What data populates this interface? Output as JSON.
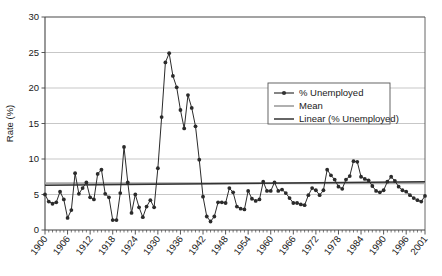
{
  "chart_data": {
    "type": "line",
    "title": "",
    "xlabel": "",
    "ylabel": "Rate (%)",
    "ylim": [
      0,
      30
    ],
    "ytick_step": 5,
    "yticks": [
      "0",
      "5",
      "10",
      "15",
      "20",
      "25",
      "30"
    ],
    "xlim": [
      1900,
      2001
    ],
    "xticks": [
      "1900",
      "1906",
      "1912",
      "1918",
      "1924",
      "1930",
      "1936",
      "1942",
      "1948",
      "1954",
      "1960",
      "1966",
      "1972",
      "1978",
      "1984",
      "1990",
      "1996",
      "2001"
    ],
    "grid": "horizontal",
    "legend_position": "inside-right-upper",
    "legend": [
      {
        "label": "% Unemployed",
        "style": "line-with-markers",
        "color": "#333333"
      },
      {
        "label": "Mean",
        "style": "line",
        "color": "#a8a8a8"
      },
      {
        "label": "Linear (% Unemployed)",
        "style": "line",
        "color": "#333333"
      }
    ],
    "series": [
      {
        "name": "% Unemployed",
        "x": [
          1900,
          1901,
          1902,
          1903,
          1904,
          1905,
          1906,
          1907,
          1908,
          1909,
          1910,
          1911,
          1912,
          1913,
          1914,
          1915,
          1916,
          1917,
          1918,
          1919,
          1920,
          1921,
          1922,
          1923,
          1924,
          1925,
          1926,
          1927,
          1928,
          1929,
          1930,
          1931,
          1932,
          1933,
          1934,
          1935,
          1936,
          1937,
          1938,
          1939,
          1940,
          1941,
          1942,
          1943,
          1944,
          1945,
          1946,
          1947,
          1948,
          1949,
          1950,
          1951,
          1952,
          1953,
          1954,
          1955,
          1956,
          1957,
          1958,
          1959,
          1960,
          1961,
          1962,
          1963,
          1964,
          1965,
          1966,
          1967,
          1968,
          1969,
          1970,
          1971,
          1972,
          1973,
          1974,
          1975,
          1976,
          1977,
          1978,
          1979,
          1980,
          1981,
          1982,
          1983,
          1984,
          1985,
          1986,
          1987,
          1988,
          1989,
          1990,
          1991,
          1992,
          1993,
          1994,
          1995,
          1996,
          1997,
          1998,
          1999,
          2000,
          2001
        ],
        "values": [
          5.0,
          4.0,
          3.7,
          3.9,
          5.4,
          4.3,
          1.7,
          2.8,
          8.0,
          5.1,
          5.9,
          6.7,
          4.6,
          4.3,
          7.9,
          8.5,
          5.1,
          4.6,
          1.4,
          1.4,
          5.2,
          11.7,
          6.7,
          2.4,
          5.0,
          3.2,
          1.8,
          3.3,
          4.2,
          3.2,
          8.7,
          15.9,
          23.6,
          24.9,
          21.7,
          20.1,
          16.9,
          14.3,
          19.0,
          17.2,
          14.6,
          9.9,
          4.7,
          1.9,
          1.2,
          1.9,
          3.9,
          3.9,
          3.8,
          5.9,
          5.3,
          3.3,
          3.0,
          2.9,
          5.5,
          4.4,
          4.1,
          4.3,
          6.8,
          5.5,
          5.5,
          6.7,
          5.5,
          5.7,
          5.2,
          4.5,
          3.8,
          3.8,
          3.6,
          3.5,
          4.9,
          5.9,
          5.6,
          4.9,
          5.6,
          8.5,
          7.7,
          7.1,
          6.1,
          5.8,
          7.1,
          7.6,
          9.7,
          9.6,
          7.5,
          7.2,
          7.0,
          6.2,
          5.5,
          5.3,
          5.6,
          6.8,
          7.5,
          6.9,
          6.1,
          5.6,
          5.4,
          4.9,
          4.5,
          4.2,
          4.0,
          4.8
        ]
      },
      {
        "name": "Mean",
        "type": "horizontal-line",
        "value": 6.6
      },
      {
        "name": "Linear (% Unemployed)",
        "type": "trend-line",
        "start_value": 6.3,
        "end_value": 6.8
      }
    ]
  }
}
